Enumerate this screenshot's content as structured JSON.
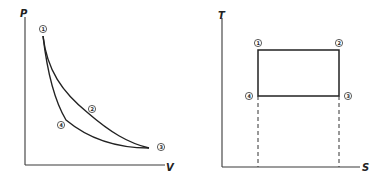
{
  "diagrams": [
    {
      "name": "pressure-volume-diagram",
      "y_axis_label": "P",
      "x_axis_label": "V",
      "states": [
        {
          "id": "1",
          "label": "1"
        },
        {
          "id": "2",
          "label": "2"
        },
        {
          "id": "3",
          "label": "3"
        },
        {
          "id": "4",
          "label": "4"
        }
      ],
      "processes": [
        {
          "from": "1",
          "to": "2",
          "via": "upper curve"
        },
        {
          "from": "2",
          "to": "3",
          "via": "upper curve"
        },
        {
          "from": "3",
          "to": "4",
          "via": "lower curve"
        },
        {
          "from": "4",
          "to": "1",
          "via": "lower curve"
        }
      ]
    },
    {
      "name": "temperature-entropy-diagram",
      "y_axis_label": "T",
      "x_axis_label": "S",
      "states": [
        {
          "id": "1",
          "label": "1"
        },
        {
          "id": "2",
          "label": "2"
        },
        {
          "id": "3",
          "label": "3"
        },
        {
          "id": "4",
          "label": "4"
        }
      ],
      "shape": "rectangle",
      "projections": "dashed vertical lines from states 4 and 3 to S axis"
    }
  ],
  "colors": {
    "line": "#222222",
    "background": "#ffffff"
  }
}
